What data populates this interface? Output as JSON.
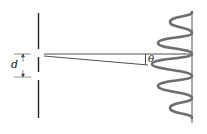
{
  "diagram": {
    "type": "double-slit-interference",
    "labels": {
      "slit_separation": "d",
      "angle": "θ"
    },
    "colors": {
      "lines": "#222222",
      "wave": "#6e6e6e",
      "screen": "#555555"
    }
  }
}
